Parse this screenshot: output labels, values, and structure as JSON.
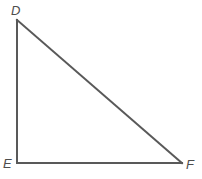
{
  "figure": {
    "name": "right-triangle-DEF",
    "background_color": "#ffffff",
    "stroke_color": "#595959",
    "stroke_width": 2,
    "label_color": "#4d4d4d",
    "vertices": [
      {
        "id": "D",
        "label": "D",
        "x": 17,
        "y": 20,
        "label_x": 11,
        "label_y": 4
      },
      {
        "id": "E",
        "label": "E",
        "x": 17,
        "y": 163,
        "label_x": 3,
        "label_y": 157
      },
      {
        "id": "F",
        "label": "F",
        "x": 182,
        "y": 163,
        "label_x": 186,
        "label_y": 158
      }
    ],
    "edges": [
      {
        "id": "DE",
        "from": "D",
        "to": "E",
        "name": "left-leg-vertical"
      },
      {
        "id": "EF",
        "from": "E",
        "to": "F",
        "name": "bottom-leg-horizontal"
      },
      {
        "id": "DF",
        "from": "D",
        "to": "F",
        "name": "hypotenuse"
      }
    ],
    "right_angle_at": "E"
  }
}
